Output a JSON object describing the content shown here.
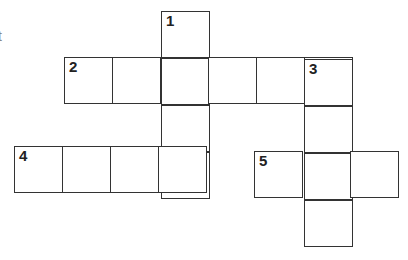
{
  "puzzle": {
    "type": "crossword",
    "edge_text": "t",
    "clue_numbers": [
      "1",
      "2",
      "3",
      "4",
      "5"
    ],
    "entries": [
      {
        "number": "1",
        "direction": "down",
        "length": 4
      },
      {
        "number": "2",
        "direction": "across",
        "length": 6
      },
      {
        "number": "3",
        "direction": "down",
        "length": 4
      },
      {
        "number": "4",
        "direction": "across",
        "length": 4
      },
      {
        "number": "5",
        "direction": "across",
        "length": 3
      }
    ],
    "line_color": "#333333",
    "cell_color": "#ffffff"
  }
}
